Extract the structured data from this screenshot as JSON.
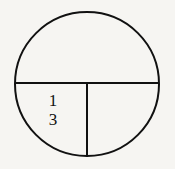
{
  "figure": {
    "background_color": "#f6f5f2",
    "stroke_color": "#111111"
  },
  "diagram": {
    "shape": "circle",
    "center_x": 87,
    "center_y": 84,
    "radius": 72,
    "stroke_width": 2.0,
    "partitions": [
      {
        "name": "horizontal-diameter",
        "orientation": "horizontal",
        "x1": 15,
        "y1": 83,
        "x2": 159,
        "y2": 83
      },
      {
        "name": "vertical-radius",
        "orientation": "vertical",
        "x1": 87,
        "y1": 83,
        "x2": 87,
        "y2": 156
      }
    ],
    "regions": [
      {
        "name": "top-half",
        "fraction": "1/2",
        "labeled": false
      },
      {
        "name": "bottom-left-quarter",
        "fraction": "1/3",
        "labeled": true
      },
      {
        "name": "bottom-right-quarter",
        "fraction": "1/4",
        "labeled": false
      }
    ]
  },
  "labels": {
    "fraction": {
      "numerator": "1",
      "denominator": "3",
      "text": "1/3",
      "x": 53,
      "y": 110
    }
  }
}
